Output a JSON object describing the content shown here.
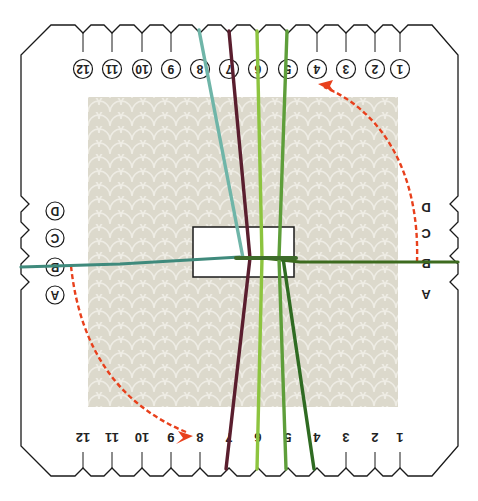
{
  "diagram": {
    "orientation": "rotated-180",
    "card": {
      "outline_color": "#1a1a1a",
      "fill_color": "#ffffff",
      "pattern_panel_color": "#dcd9cc",
      "pattern_highlight_color": "#ecebe3"
    },
    "top_notches": {
      "labels": [
        "12",
        "11",
        "10",
        "9",
        "8",
        "7",
        "6",
        "5",
        "4",
        "3",
        "2",
        "1"
      ],
      "circled": true
    },
    "bottom_notches": {
      "labels": [
        "12",
        "11",
        "10",
        "9",
        "8",
        "7",
        "6",
        "5",
        "4",
        "3",
        "2",
        "1"
      ],
      "circled": false
    },
    "left_notches": {
      "labels": [
        "D",
        "C",
        "B",
        "A"
      ],
      "circled": true
    },
    "right_notches": {
      "labels": [
        "D",
        "C",
        "B",
        "A"
      ],
      "circled": false
    },
    "center_slot": {
      "shape": "rectangle"
    },
    "threads": [
      {
        "name": "teal",
        "color": "#6fb5a8",
        "from": "top 8",
        "to": "center"
      },
      {
        "name": "dark-teal-horizontal",
        "color": "#3f8a7c",
        "from": "left B",
        "to": "center"
      },
      {
        "name": "burgundy",
        "color": "#5a1e2e",
        "from": "top 7",
        "to": "bottom 7"
      },
      {
        "name": "lime",
        "color": "#8dc43f",
        "from": "top 6",
        "to": "bottom 6"
      },
      {
        "name": "green",
        "color": "#5e9e3a",
        "from": "top 5",
        "to": "bottom 5"
      },
      {
        "name": "dark-green",
        "color": "#2f6b22",
        "from": "center",
        "to": "bottom 4"
      },
      {
        "name": "dark-green-horizontal",
        "color": "#3d6b1f",
        "from": "right B",
        "to": "center"
      }
    ],
    "arrows": [
      {
        "color": "#e8401c",
        "style": "dashed",
        "from": "right B",
        "to": "top 4"
      },
      {
        "color": "#e8401c",
        "style": "dashed",
        "from": "left B",
        "to": "bottom 8"
      }
    ]
  }
}
